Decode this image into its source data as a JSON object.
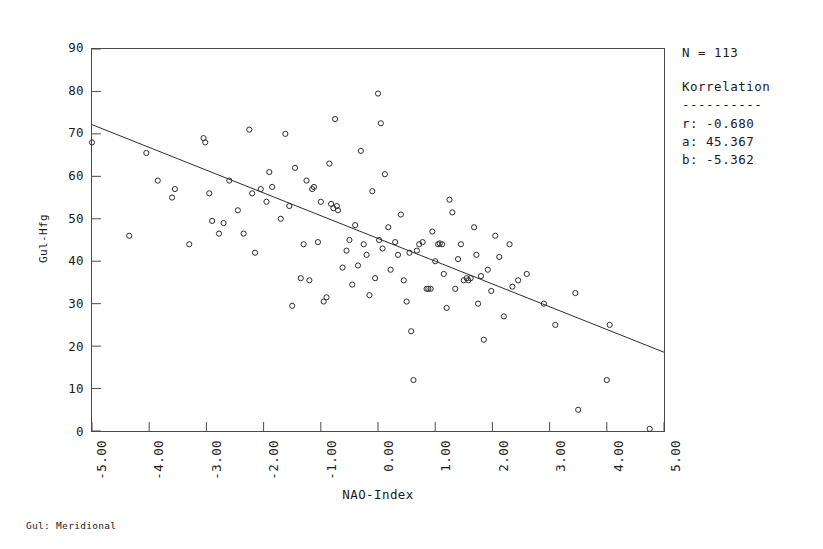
{
  "caption": "Gul: Meridional",
  "axes": {
    "x_title": "NAO-Index",
    "y_title": "Gul-Hfg",
    "x_ticks": [
      "-5.00",
      "-4.00",
      "-3.00",
      "-2.00",
      "-1.00",
      "0.00",
      "1.00",
      "2.00",
      "3.00",
      "4.00",
      "5.00"
    ],
    "y_ticks": [
      "90",
      "80",
      "70",
      "60",
      "50",
      "40",
      "30",
      "20",
      "10",
      "0"
    ]
  },
  "stats": {
    "n_label": "N = 113",
    "title": "Korrelation",
    "rule": "----------",
    "r_line": "r: -0.680",
    "a_line": "a: 45.367",
    "b_line": "b: -5.362"
  },
  "chart_data": {
    "type": "scatter",
    "title": "",
    "xlabel": "NAO-Index",
    "ylabel": "Gul-Hfg",
    "xlim": [
      -5,
      5
    ],
    "ylim": [
      0,
      90
    ],
    "xtick_values": [
      -5,
      -4,
      -3,
      -2,
      -1,
      0,
      1,
      2,
      3,
      4,
      5
    ],
    "ytick_values": [
      0,
      10,
      20,
      30,
      40,
      50,
      60,
      70,
      80,
      90
    ],
    "grid": false,
    "legend_position": "right-outside",
    "n": 113,
    "correlation": {
      "r": -0.68,
      "intercept_a": 45.367,
      "slope_b": -5.362
    },
    "regression_line": {
      "x": [
        -5,
        5
      ],
      "y": [
        72.177,
        18.557
      ]
    },
    "marker": "open-circle",
    "points": [
      [
        -5.0,
        68.0
      ],
      [
        -4.35,
        46.0
      ],
      [
        -4.05,
        65.5
      ],
      [
        -3.85,
        59.0
      ],
      [
        -3.6,
        55.0
      ],
      [
        -3.55,
        57.0
      ],
      [
        -3.3,
        44.0
      ],
      [
        -3.05,
        69.0
      ],
      [
        -3.02,
        68.0
      ],
      [
        -2.95,
        56.0
      ],
      [
        -2.9,
        49.5
      ],
      [
        -2.78,
        46.5
      ],
      [
        -2.7,
        49.0
      ],
      [
        -2.6,
        59.0
      ],
      [
        -2.45,
        52.0
      ],
      [
        -2.35,
        46.5
      ],
      [
        -2.25,
        71.0
      ],
      [
        -2.2,
        56.0
      ],
      [
        -2.15,
        42.0
      ],
      [
        -2.05,
        57.0
      ],
      [
        -1.95,
        54.0
      ],
      [
        -1.9,
        61.0
      ],
      [
        -1.85,
        57.5
      ],
      [
        -1.7,
        50.0
      ],
      [
        -1.62,
        70.0
      ],
      [
        -1.55,
        53.0
      ],
      [
        -1.5,
        29.5
      ],
      [
        -1.45,
        62.0
      ],
      [
        -1.35,
        36.0
      ],
      [
        -1.3,
        44.0
      ],
      [
        -1.25,
        59.0
      ],
      [
        -1.2,
        35.5
      ],
      [
        -1.15,
        57.0
      ],
      [
        -1.12,
        57.5
      ],
      [
        -1.05,
        44.5
      ],
      [
        -1.0,
        54.0
      ],
      [
        -0.95,
        30.5
      ],
      [
        -0.9,
        31.5
      ],
      [
        -0.85,
        63.0
      ],
      [
        -0.82,
        53.5
      ],
      [
        -0.78,
        52.5
      ],
      [
        -0.75,
        73.5
      ],
      [
        -0.72,
        53.0
      ],
      [
        -0.7,
        52.0
      ],
      [
        -0.62,
        38.5
      ],
      [
        -0.55,
        42.5
      ],
      [
        -0.5,
        45.0
      ],
      [
        -0.45,
        34.5
      ],
      [
        -0.4,
        48.5
      ],
      [
        -0.35,
        39.0
      ],
      [
        -0.3,
        66.0
      ],
      [
        -0.25,
        44.0
      ],
      [
        -0.2,
        41.5
      ],
      [
        -0.15,
        32.0
      ],
      [
        -0.1,
        56.5
      ],
      [
        -0.05,
        36.0
      ],
      [
        0.0,
        79.5
      ],
      [
        0.02,
        45.0
      ],
      [
        0.05,
        72.5
      ],
      [
        0.08,
        43.0
      ],
      [
        0.12,
        60.5
      ],
      [
        0.18,
        48.0
      ],
      [
        0.22,
        38.0
      ],
      [
        0.3,
        44.5
      ],
      [
        0.35,
        41.5
      ],
      [
        0.4,
        51.0
      ],
      [
        0.45,
        35.5
      ],
      [
        0.5,
        30.5
      ],
      [
        0.55,
        42.0
      ],
      [
        0.58,
        23.5
      ],
      [
        0.62,
        12.0
      ],
      [
        0.68,
        42.5
      ],
      [
        0.72,
        44.0
      ],
      [
        0.78,
        44.5
      ],
      [
        0.85,
        33.5
      ],
      [
        0.88,
        33.5
      ],
      [
        0.92,
        33.5
      ],
      [
        0.95,
        47.0
      ],
      [
        1.0,
        40.0
      ],
      [
        1.05,
        44.0
      ],
      [
        1.08,
        44.2
      ],
      [
        1.12,
        44.0
      ],
      [
        1.15,
        37.0
      ],
      [
        1.2,
        29.0
      ],
      [
        1.25,
        54.5
      ],
      [
        1.3,
        51.5
      ],
      [
        1.35,
        33.5
      ],
      [
        1.4,
        40.5
      ],
      [
        1.45,
        44.0
      ],
      [
        1.5,
        35.5
      ],
      [
        1.55,
        36.0
      ],
      [
        1.58,
        35.5
      ],
      [
        1.62,
        36.0
      ],
      [
        1.68,
        48.0
      ],
      [
        1.72,
        41.5
      ],
      [
        1.75,
        30.0
      ],
      [
        1.8,
        36.5
      ],
      [
        1.85,
        21.5
      ],
      [
        1.92,
        38.0
      ],
      [
        1.98,
        33.0
      ],
      [
        2.05,
        46.0
      ],
      [
        2.12,
        41.0
      ],
      [
        2.2,
        27.0
      ],
      [
        2.3,
        44.0
      ],
      [
        2.35,
        34.0
      ],
      [
        2.45,
        35.5
      ],
      [
        2.6,
        37.0
      ],
      [
        2.9,
        30.0
      ],
      [
        3.1,
        25.0
      ],
      [
        3.45,
        32.5
      ],
      [
        3.5,
        5.0
      ],
      [
        4.05,
        25.0
      ],
      [
        4.0,
        12.0
      ],
      [
        4.75,
        0.5
      ]
    ]
  }
}
